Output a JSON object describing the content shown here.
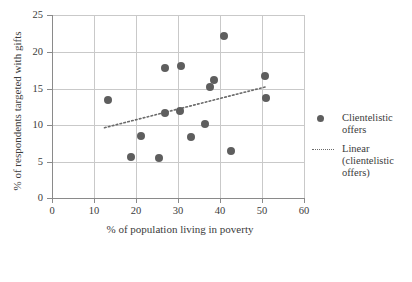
{
  "chart_data": {
    "type": "scatter",
    "title": "",
    "xlabel": "% of population living in poverty",
    "ylabel": "% of respondents targeted with gifts",
    "xlim": [
      0,
      60
    ],
    "ylim": [
      0,
      25
    ],
    "xticks": [
      0,
      10,
      20,
      30,
      40,
      50,
      60
    ],
    "yticks": [
      0,
      5,
      10,
      15,
      20,
      25
    ],
    "grid": true,
    "legend_position": "right",
    "marker_color": "#5e5e5e",
    "trendline_color": "#6a6a6a",
    "series": [
      {
        "name": "Clientelistic offers",
        "type": "scatter",
        "points": [
          {
            "x": 13.3,
            "y": 13.4
          },
          {
            "x": 18.8,
            "y": 5.6
          },
          {
            "x": 21.3,
            "y": 8.5
          },
          {
            "x": 25.5,
            "y": 5.4
          },
          {
            "x": 26.8,
            "y": 11.6
          },
          {
            "x": 27.0,
            "y": 17.8
          },
          {
            "x": 30.5,
            "y": 11.9
          },
          {
            "x": 30.8,
            "y": 18.0
          },
          {
            "x": 33.0,
            "y": 8.3
          },
          {
            "x": 36.5,
            "y": 10.1
          },
          {
            "x": 37.5,
            "y": 15.1
          },
          {
            "x": 38.5,
            "y": 16.1
          },
          {
            "x": 41.0,
            "y": 22.1
          },
          {
            "x": 42.5,
            "y": 6.4
          },
          {
            "x": 50.8,
            "y": 16.7
          },
          {
            "x": 51.0,
            "y": 13.6
          }
        ]
      },
      {
        "name": "Linear (clientelistic offers)",
        "type": "line",
        "style": "dotted",
        "endpoints": [
          {
            "x": 12.5,
            "y": 9.6
          },
          {
            "x": 51.0,
            "y": 15.2
          }
        ]
      }
    ]
  },
  "axes": {
    "x_title": "% of population living in poverty",
    "y_title": "% of respondents targeted with gifts",
    "x_tick_labels": [
      "0",
      "10",
      "20",
      "30",
      "40",
      "50",
      "60"
    ],
    "y_tick_labels": [
      "0",
      "5",
      "10",
      "15",
      "20",
      "25"
    ]
  },
  "legend": {
    "entries": [
      {
        "marker": "dot-marker-icon",
        "label": "Clientelistic offers"
      },
      {
        "marker": "dotted-line-icon",
        "label": "Linear (clientelistic offers)"
      }
    ]
  },
  "caption": {
    "partial_text": ""
  }
}
